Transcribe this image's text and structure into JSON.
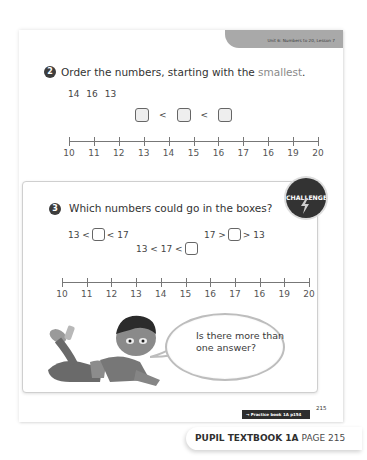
{
  "header": {
    "unit_label": "Unit 6: Numbers to 20, Lesson 7"
  },
  "question2": {
    "number": "2",
    "text_before": "Order the numbers, starting with the ",
    "text_highlight": "smallest",
    "text_after": ".",
    "numbers_given": [
      "14",
      "16",
      "13"
    ],
    "comparison_symbols": [
      "<",
      "<"
    ],
    "number_line_labels": [
      "10",
      "11",
      "12",
      "13",
      "14",
      "15",
      "16",
      "17",
      "16",
      "19",
      "20"
    ]
  },
  "question3": {
    "number": "3",
    "text": "Which numbers could go in the boxes?",
    "challenge_badge": "CHALLENGE",
    "inequalities": [
      {
        "left": "13 <",
        "right": "< 17"
      },
      {
        "left": "17 >",
        "right": "> 13"
      },
      {
        "left": "13 < 17 <",
        "right": ""
      }
    ],
    "number_line_labels": [
      "10",
      "11",
      "12",
      "13",
      "14",
      "15",
      "16",
      "17",
      "16",
      "19",
      "20"
    ],
    "speech_bubble": {
      "line1": "Is there more than",
      "line2": "one answer?"
    }
  },
  "footer": {
    "page_number": "215",
    "practice_link": "→ Practice book 1A p154",
    "book_title": "PUPIL TEXTBOOK 1A",
    "page_label": "PAGE 215"
  },
  "colors": {
    "badge": "#3d3d3d",
    "header_tab": "#a9a9a9",
    "highlight_text": "#8a8a8a",
    "practice_link_bg": "#2e2e2e"
  }
}
